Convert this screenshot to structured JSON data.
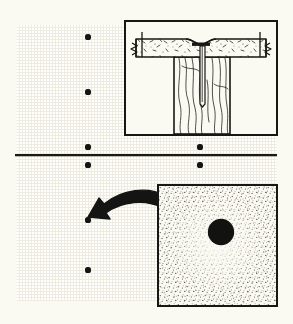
{
  "figure": {
    "background_color": "#fbfaf2",
    "wall_color": "#eeece1",
    "ink_color": "#171714"
  },
  "wall": {
    "name": "drywall-wall-surface",
    "seam": {
      "name": "horizontal-seam-line",
      "label": "Horizontal drywall joint",
      "x1": 15,
      "y1": 155,
      "x2": 277,
      "y2": 155,
      "color": "#1a1a17"
    },
    "nail_dots": [
      {
        "id": "nail-1",
        "x": 88,
        "y": 37,
        "r": 2.6
      },
      {
        "id": "nail-2",
        "x": 88,
        "y": 92,
        "r": 2.6
      },
      {
        "id": "nail-3",
        "x": 88,
        "y": 147,
        "r": 2.6
      },
      {
        "id": "nail-4",
        "x": 200,
        "y": 147,
        "r": 2.6
      },
      {
        "id": "nail-5",
        "x": 88,
        "y": 165,
        "r": 2.6
      },
      {
        "id": "nail-6",
        "x": 200,
        "y": 165,
        "r": 2.6
      },
      {
        "id": "nail-7",
        "x": 88,
        "y": 220,
        "r": 2.6
      },
      {
        "id": "nail-8",
        "x": 88,
        "y": 270,
        "r": 2.6
      }
    ],
    "dot_color": "#141412"
  },
  "section_detail": {
    "name": "cross-section-detail-panel",
    "caption": "Cutaway section: nail through drywall into wood stud",
    "frame": {
      "x": 124,
      "y": 20,
      "width": 154,
      "height": 116
    },
    "parts": [
      {
        "name": "drywall-panel",
        "label": "Drywall / wallboard layer",
        "hatch": "speckled-fleck"
      },
      {
        "name": "wood-stud",
        "label": "Wood framing stud",
        "hatch": "wood-grain"
      },
      {
        "name": "nail",
        "label": "Nail driven through board into stud"
      },
      {
        "name": "nail-head",
        "label": "Nail head seated in dimple"
      },
      {
        "name": "dimple",
        "label": "Dimpled depression around nail head"
      },
      {
        "name": "break-line-left",
        "label": "Break line"
      },
      {
        "name": "break-line-right",
        "label": "Break line"
      }
    ]
  },
  "photo_detail": {
    "name": "photo-detail-panel",
    "caption": "Close-up: popped nail head with shadowed dimple",
    "frame": {
      "x": 157,
      "y": 184,
      "width": 121,
      "height": 123
    },
    "texture": "stipple-grain",
    "elements": [
      {
        "name": "nail-head-circle",
        "label": "Nail head",
        "cx": 218,
        "cy": 245,
        "r": 12,
        "color": "#121210"
      },
      {
        "name": "dimple-shadow-crescent",
        "label": "Shadow crescent in dimple",
        "sweep": "upper-left"
      }
    ]
  },
  "callout_arrow": {
    "name": "callout-arrow",
    "label": "Arrow linking photo detail to nail on wall",
    "from": {
      "x": 160,
      "y": 205
    },
    "to": {
      "x": 95,
      "y": 220
    },
    "color": "#141412"
  }
}
